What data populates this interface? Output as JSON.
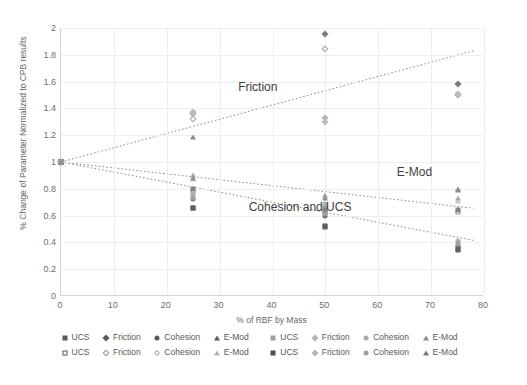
{
  "chart_data": {
    "type": "scatter",
    "title": "",
    "xlabel": "% of RBF by Mass",
    "ylabel": "% Change of Parameter Normalized to CPB results",
    "xlim": [
      0,
      80
    ],
    "ylim": [
      0,
      2
    ],
    "xticks": [
      "0",
      "10",
      "20",
      "30",
      "40",
      "50",
      "60",
      "70",
      "80"
    ],
    "yticks": [
      "0",
      "0.2",
      "0.4",
      "0.6",
      "0.8",
      "1",
      "1.2",
      "1.4",
      "1.6",
      "1.8",
      "2"
    ],
    "grid": true,
    "legend_position": "bottom",
    "annotations": [
      {
        "text": "Friction",
        "x": 33.5,
        "y": 1.555
      },
      {
        "text": "E-Mod",
        "x": 63.5,
        "y": 0.92
      },
      {
        "text": "Cohesion and UCS",
        "x": 35.5,
        "y": 0.655
      }
    ],
    "series": [
      {
        "name": "UCS",
        "marker": "square",
        "fill": "filled",
        "color": "#6b6b6b",
        "points": [
          [
            0,
            1.0
          ],
          [
            25,
            0.655
          ],
          [
            50,
            0.515
          ],
          [
            75,
            0.345
          ]
        ]
      },
      {
        "name": "Friction",
        "marker": "diamond",
        "fill": "filled",
        "color": "#7b7b7b",
        "points": [
          [
            0,
            1.0
          ],
          [
            25,
            1.365
          ],
          [
            50,
            1.955
          ],
          [
            75,
            1.585
          ]
        ]
      },
      {
        "name": "Cohesion",
        "marker": "circle",
        "fill": "filled",
        "color": "#6f6f6f",
        "points": [
          [
            0,
            1.0
          ],
          [
            25,
            0.725
          ],
          [
            50,
            0.6
          ],
          [
            75,
            0.375
          ]
        ]
      },
      {
        "name": "E-Mod",
        "marker": "triangle",
        "fill": "filled",
        "color": "#8a8a8a",
        "points": [
          [
            0,
            1.0
          ],
          [
            25,
            1.185
          ],
          [
            50,
            0.68
          ],
          [
            75,
            0.79
          ]
        ]
      },
      {
        "name": "UCS",
        "marker": "square",
        "fill": "open",
        "color": "#8d8d8d",
        "points": [
          [
            0,
            1.0
          ],
          [
            25,
            0.775
          ],
          [
            50,
            0.625
          ],
          [
            75,
            0.625
          ]
        ]
      },
      {
        "name": "Friction",
        "marker": "diamond",
        "fill": "open",
        "color": "#a3a3a3",
        "points": [
          [
            0,
            1.0
          ],
          [
            25,
            1.32
          ],
          [
            50,
            1.845
          ],
          [
            75,
            1.5
          ]
        ]
      },
      {
        "name": "Cohesion",
        "marker": "circle",
        "fill": "open",
        "color": "#9b9b9b",
        "points": [
          [
            0,
            1.0
          ],
          [
            25,
            0.745
          ],
          [
            50,
            0.665
          ],
          [
            75,
            0.41
          ]
        ]
      },
      {
        "name": "E-Mod",
        "marker": "triangle",
        "fill": "open",
        "color": "#9e9e9e",
        "points": [
          [
            0,
            1.0
          ],
          [
            25,
            0.875
          ],
          [
            50,
            0.745
          ],
          [
            75,
            0.71
          ]
        ]
      },
      {
        "name": "UCS",
        "marker": "square",
        "fill": "filled2",
        "color": "#848484",
        "points": [
          [
            0,
            1.0
          ],
          [
            25,
            0.8
          ],
          [
            50,
            0.645
          ],
          [
            75,
            0.64
          ]
        ]
      },
      {
        "name": "Friction",
        "marker": "diamond",
        "fill": "faint",
        "color": "#b5b5b5",
        "points": [
          [
            0,
            1.0
          ],
          [
            25,
            1.355
          ],
          [
            50,
            1.325
          ],
          [
            75,
            1.505
          ]
        ]
      },
      {
        "name": "Cohesion",
        "marker": "circle",
        "fill": "faint",
        "color": "#aeaeae",
        "points": [
          [
            0,
            1.0
          ],
          [
            25,
            0.76
          ],
          [
            50,
            0.69
          ],
          [
            75,
            0.4
          ]
        ]
      },
      {
        "name": "E-Mod",
        "marker": "triangle",
        "fill": "faint",
        "color": "#a8a8a8",
        "points": [
          [
            0,
            1.0
          ],
          [
            25,
            0.9
          ],
          [
            50,
            0.755
          ],
          [
            75,
            0.735
          ]
        ]
      },
      {
        "name": "UCS",
        "marker": "square",
        "fill": "filled3",
        "color": "#5f5f5f",
        "points": [
          [
            0,
            1.0
          ],
          [
            25,
            0.66
          ],
          [
            50,
            0.52
          ],
          [
            75,
            0.35
          ]
        ]
      },
      {
        "name": "Friction",
        "marker": "diamond",
        "fill": "faint2",
        "color": "#bcbcbc",
        "points": [
          [
            0,
            1.0
          ],
          [
            25,
            1.37
          ],
          [
            50,
            1.3
          ],
          [
            75,
            1.51
          ]
        ]
      },
      {
        "name": "Cohesion",
        "marker": "circle",
        "fill": "faint2",
        "color": "#9f9f9f",
        "points": [
          [
            0,
            1.0
          ],
          [
            25,
            0.735
          ],
          [
            50,
            0.615
          ],
          [
            75,
            0.385
          ]
        ]
      },
      {
        "name": "E-Mod",
        "marker": "triangle",
        "fill": "faint2",
        "color": "#8f8f8f",
        "points": [
          [
            0,
            1.0
          ],
          [
            25,
            0.88
          ],
          [
            50,
            0.735
          ],
          [
            75,
            0.8
          ]
        ]
      }
    ],
    "trendlines": [
      {
        "name": "Friction trend",
        "x0": 0,
        "y0": 1.0,
        "x1": 78,
        "y1": 1.83,
        "style": "dotted"
      },
      {
        "name": "E-Mod trend",
        "x0": 0,
        "y0": 1.0,
        "x1": 78,
        "y1": 0.655,
        "style": "dotted"
      },
      {
        "name": "Cohesion and UCS trend",
        "x0": 0,
        "y0": 1.0,
        "x1": 78,
        "y1": 0.415,
        "style": "dotted"
      }
    ]
  },
  "legend": {
    "row1": [
      {
        "label": "UCS",
        "marker": "square",
        "fill": "filled",
        "color": "#595959"
      },
      {
        "label": "Friction",
        "marker": "diamond",
        "fill": "filled",
        "color": "#595959"
      },
      {
        "label": "Cohesion",
        "marker": "circle",
        "fill": "filled",
        "color": "#595959"
      },
      {
        "label": "E-Mod",
        "marker": "triangle",
        "fill": "filled",
        "color": "#595959"
      },
      {
        "label": "UCS",
        "marker": "square",
        "fill": "filled",
        "color": "#a0a0a0"
      },
      {
        "label": "Friction",
        "marker": "diamond",
        "fill": "filled",
        "color": "#b4b4b4"
      },
      {
        "label": "Cohesion",
        "marker": "circle",
        "fill": "filled",
        "color": "#a8a8a8"
      },
      {
        "label": "E-Mod",
        "marker": "triangle",
        "fill": "filled",
        "color": "#8e8e8e"
      }
    ],
    "row2": [
      {
        "label": "UCS",
        "marker": "square",
        "fill": "open",
        "color": "#595959"
      },
      {
        "label": "Friction",
        "marker": "diamond",
        "fill": "open",
        "color": "#9a9a9a"
      },
      {
        "label": "Cohesion",
        "marker": "circle",
        "fill": "open",
        "color": "#9a9a9a"
      },
      {
        "label": "E-Mod",
        "marker": "triangle",
        "fill": "open",
        "color": "#6f6f6f"
      },
      {
        "label": "UCS",
        "marker": "square",
        "fill": "filled",
        "color": "#4d4d4d"
      },
      {
        "label": "Friction",
        "marker": "diamond",
        "fill": "filled",
        "color": "#b4b4b4"
      },
      {
        "label": "Cohesion",
        "marker": "circle",
        "fill": "filled",
        "color": "#9e9e9e"
      },
      {
        "label": "E-Mod",
        "marker": "triangle",
        "fill": "filled",
        "color": "#7a7a7a"
      }
    ]
  }
}
